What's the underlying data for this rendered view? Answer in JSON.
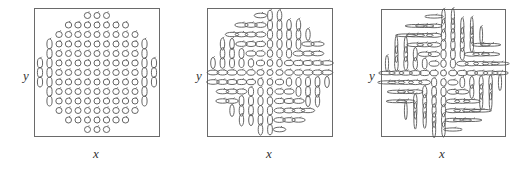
{
  "figure": {
    "panels": [
      {
        "id": "panel-1",
        "xlabel": "x",
        "ylabel": "y",
        "frame": {
          "left": 34,
          "top": 8,
          "width": 126,
          "height": 129
        },
        "deformation": 0.0
      },
      {
        "id": "panel-2",
        "xlabel": "x",
        "ylabel": "y",
        "frame": {
          "left": 207,
          "top": 8,
          "width": 126,
          "height": 129
        },
        "deformation": 0.5
      },
      {
        "id": "panel-3",
        "xlabel": "x",
        "ylabel": "y",
        "frame": {
          "left": 381,
          "top": 9,
          "width": 125,
          "height": 128
        },
        "deformation": 1.0
      }
    ],
    "grid": {
      "rows": 13,
      "cols": 13
    },
    "stroke_color": "#555555",
    "frame_color": "#6a6a6a"
  }
}
